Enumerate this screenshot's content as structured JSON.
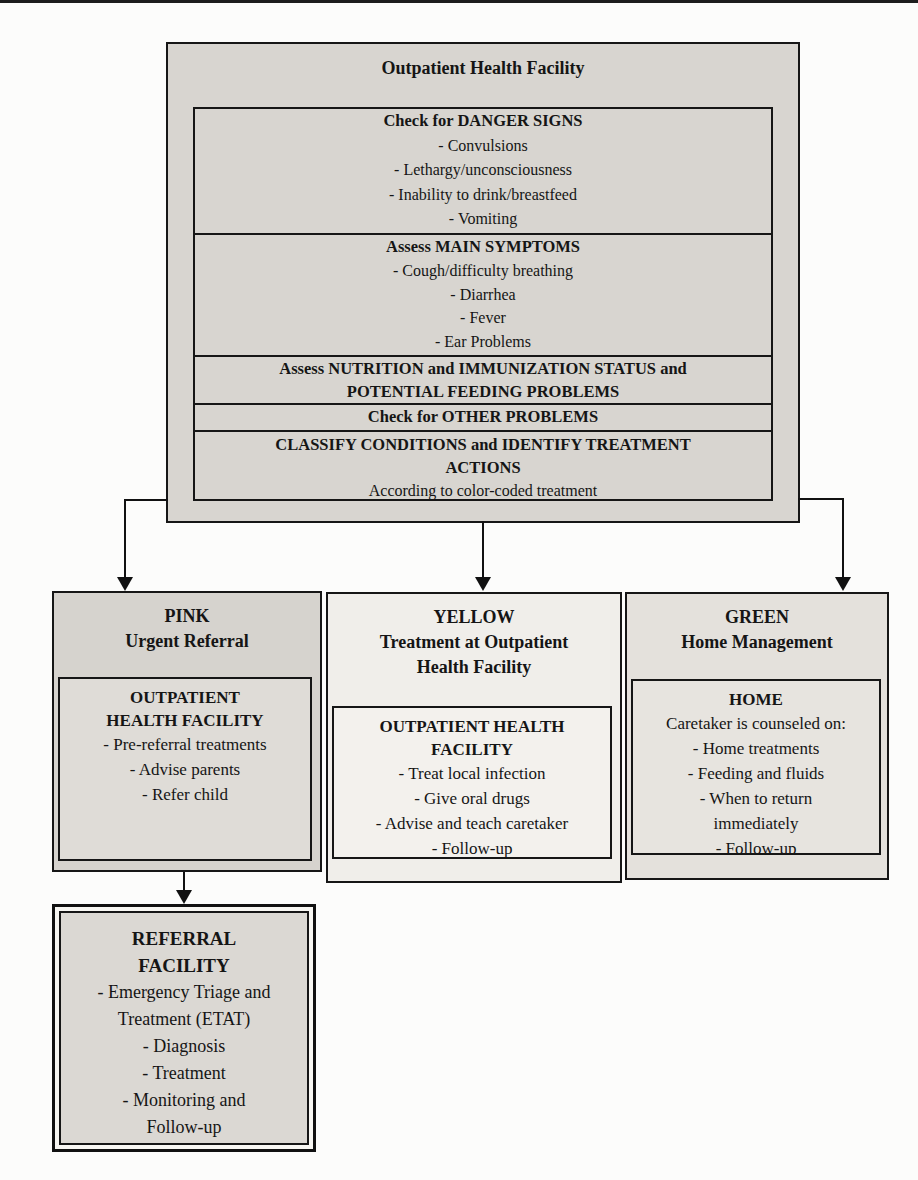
{
  "facility_box": {
    "title": "Outpatient Health Facility",
    "sections": [
      {
        "heading": [
          "Check for DANGER SIGNS"
        ],
        "items": [
          "- Convulsions",
          "- Lethargy/unconsciousness",
          "- Inability to drink/breastfeed",
          "- Vomiting"
        ]
      },
      {
        "heading": [
          "Assess MAIN SYMPTOMS"
        ],
        "items": [
          "- Cough/difficulty breathing",
          "- Diarrhea",
          "- Fever",
          "- Ear Problems"
        ]
      },
      {
        "heading": [
          "Assess NUTRITION and IMMUNIZATION STATUS and",
          "POTENTIAL FEEDING PROBLEMS"
        ],
        "items": []
      },
      {
        "heading": [
          "Check for OTHER PROBLEMS"
        ],
        "items": []
      },
      {
        "heading": [
          "CLASSIFY CONDITIONS and IDENTIFY TREATMENT",
          "ACTIONS"
        ],
        "items": [
          "According to color-coded treatment"
        ]
      }
    ]
  },
  "branches": {
    "pink": {
      "header": [
        "PINK",
        "Urgent Referral"
      ],
      "inner_title": [
        "OUTPATIENT",
        "HEALTH FACILITY"
      ],
      "inner_items": [
        "- Pre-referral treatments",
        "- Advise parents",
        "- Refer child"
      ]
    },
    "yellow": {
      "header": [
        "YELLOW",
        "Treatment at Outpatient",
        "Health Facility"
      ],
      "inner_title": [
        "OUTPATIENT HEALTH",
        "FACILITY"
      ],
      "inner_items": [
        "- Treat local infection",
        "- Give oral drugs",
        "- Advise and teach caretaker",
        "- Follow-up"
      ]
    },
    "green": {
      "header": [
        "GREEN",
        "Home Management"
      ],
      "inner_title": [
        "HOME"
      ],
      "inner_intro": "Caretaker is counseled on:",
      "inner_items": [
        "- Home treatments",
        "- Feeding and fluids",
        "- When to return",
        "immediately",
        "- Follow-up"
      ]
    }
  },
  "referral_box": {
    "title": [
      "REFERRAL",
      "FACILITY"
    ],
    "items": [
      "- Emergency Triage and",
      "Treatment (ETAT)",
      "- Diagnosis",
      "- Treatment",
      "- Monitoring and",
      "Follow-up"
    ]
  },
  "colors": {
    "top_box_fill": "#d8d5d0",
    "pink_box_fill": "#d6d3ce",
    "yellow_box_fill": "#f0eeea",
    "green_box_fill": "#e4e1dc",
    "referral_box_fill": "#dbd8d3",
    "border": "#161616"
  }
}
